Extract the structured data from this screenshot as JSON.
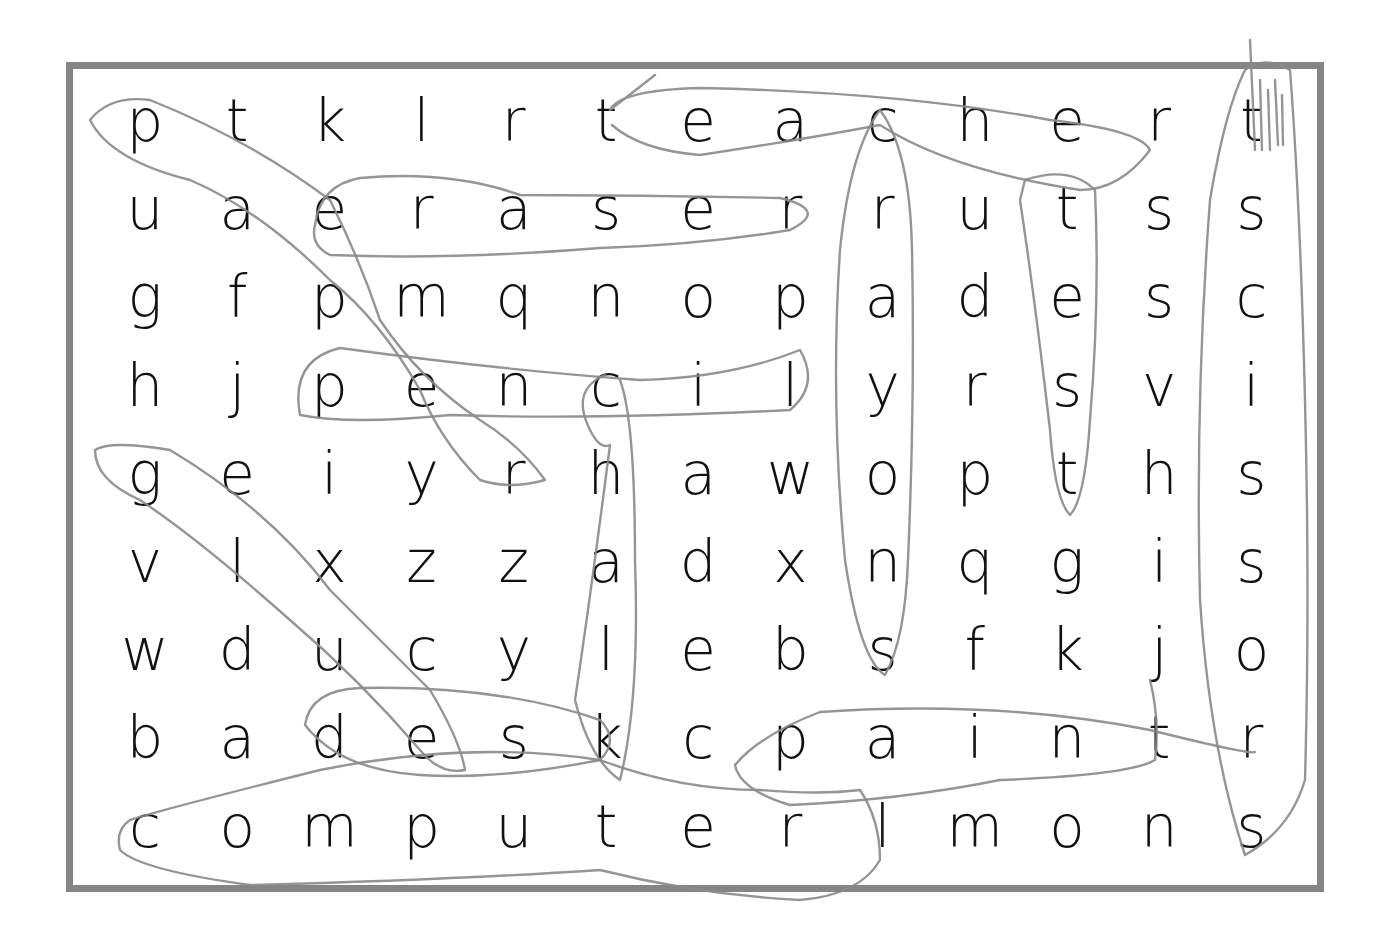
{
  "puzzle": {
    "type": "word-search",
    "rows": [
      [
        "p",
        "t",
        "k",
        "l",
        "r",
        "t",
        "e",
        "a",
        "c",
        "h",
        "e",
        "r",
        "t"
      ],
      [
        "u",
        "a",
        "e",
        "r",
        "a",
        "s",
        "e",
        "r",
        "r",
        "u",
        "t",
        "s",
        "s"
      ],
      [
        "g",
        "f",
        "p",
        "m",
        "q",
        "n",
        "o",
        "p",
        "a",
        "d",
        "e",
        "s",
        "c"
      ],
      [
        "h",
        "j",
        "p",
        "e",
        "n",
        "c",
        "i",
        "l",
        "y",
        "r",
        "s",
        "v",
        "i"
      ],
      [
        "g",
        "e",
        "i",
        "y",
        "r",
        "h",
        "a",
        "w",
        "o",
        "p",
        "t",
        "h",
        "s"
      ],
      [
        "v",
        "l",
        "x",
        "z",
        "z",
        "a",
        "d",
        "x",
        "n",
        "q",
        "g",
        "i",
        "s"
      ],
      [
        "w",
        "d",
        "u",
        "c",
        "y",
        "l",
        "e",
        "b",
        "s",
        "f",
        "k",
        "j",
        "o"
      ],
      [
        "b",
        "a",
        "d",
        "e",
        "s",
        "k",
        "c",
        "p",
        "a",
        "i",
        "n",
        "t",
        "r"
      ],
      [
        "c",
        "o",
        "m",
        "p",
        "u",
        "t",
        "e",
        "r",
        "l",
        "m",
        "o",
        "n",
        "s"
      ]
    ],
    "circled_words": [
      "teacher",
      "eraser",
      "pencil",
      "chalk",
      "crayons",
      "test",
      "scissors",
      "desk",
      "paint",
      "computer",
      "paper",
      "glue"
    ],
    "colors": {
      "frame": "#858585",
      "text": "#111111",
      "pencil": "#8a8a8a",
      "background": "#ffffff"
    }
  }
}
